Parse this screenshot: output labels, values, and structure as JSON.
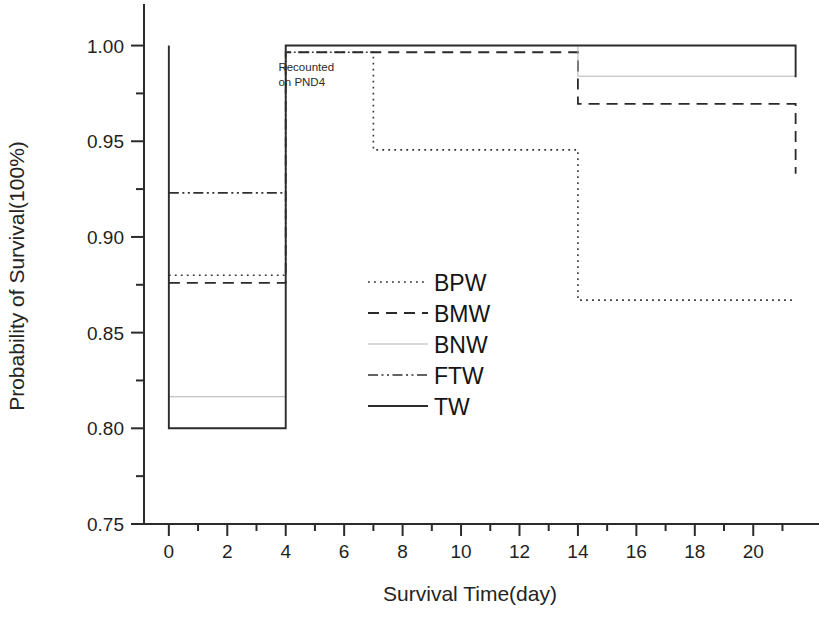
{
  "chart_data": {
    "type": "line",
    "title": "",
    "xlabel": "Survival Time(day)",
    "ylabel": "Probability of Survival(100%)",
    "xlim": [
      -0.85,
      21.6
    ],
    "ylim": [
      0.75,
      1.005
    ],
    "xticks": [
      0,
      2,
      4,
      6,
      8,
      10,
      12,
      14,
      16,
      18,
      20
    ],
    "xticklabels": [
      "0",
      "2",
      "4",
      "6",
      "8",
      "10",
      "12",
      "14",
      "16",
      "18",
      "20"
    ],
    "xminorticks": [
      1,
      3,
      5,
      7,
      9,
      11,
      13,
      15,
      17,
      19,
      21
    ],
    "yticks": [
      0.75,
      0.8,
      0.85,
      0.9,
      0.95,
      1.0
    ],
    "yticklabels": [
      "0.75",
      "0.80",
      "0.85",
      "0.90",
      "0.95",
      "1.00"
    ],
    "yminorticks": [
      0.775,
      0.825,
      0.875,
      0.925,
      0.975
    ],
    "grid": false,
    "legend_position": "center",
    "annotations": [
      {
        "name": "recounted-note",
        "line1": "Recounted",
        "line2": "on PND4",
        "x": 3.75,
        "y": 0.9865
      }
    ],
    "series": [
      {
        "name": "BPW",
        "style": "dotted",
        "color": "#333333",
        "width": 1.6,
        "steps": [
          {
            "x": 0,
            "y": 0.88
          },
          {
            "x": 4,
            "y": 0.88
          },
          {
            "x": 4,
            "y": 0.9965
          },
          {
            "x": 7,
            "y": 0.9965
          },
          {
            "x": 7,
            "y": 0.9455
          },
          {
            "x": 14,
            "y": 0.9455
          },
          {
            "x": 14,
            "y": 0.867
          },
          {
            "x": 21.45,
            "y": 0.867
          }
        ]
      },
      {
        "name": "BMW",
        "style": "dashed",
        "color": "#2a2a2a",
        "width": 1.8,
        "steps": [
          {
            "x": 0,
            "y": 0.876
          },
          {
            "x": 4,
            "y": 0.876
          },
          {
            "x": 4,
            "y": 0.9965
          },
          {
            "x": 14,
            "y": 0.9965
          },
          {
            "x": 14,
            "y": 0.9695
          },
          {
            "x": 21.45,
            "y": 0.9695
          },
          {
            "x": 21.45,
            "y": 0.933
          }
        ]
      },
      {
        "name": "BNW",
        "style": "thin-solid",
        "color": "#b4b4b4",
        "width": 1.0,
        "steps": [
          {
            "x": 0,
            "y": 0.8165
          },
          {
            "x": 4,
            "y": 0.8165
          },
          {
            "x": 4,
            "y": 1.0
          },
          {
            "x": 14,
            "y": 1.0
          },
          {
            "x": 14,
            "y": 0.984
          },
          {
            "x": 21.45,
            "y": 0.984
          }
        ]
      },
      {
        "name": "FTW",
        "style": "dash-dot-dot",
        "color": "#303030",
        "width": 1.7,
        "steps": [
          {
            "x": 0,
            "y": 0.923
          },
          {
            "x": 4,
            "y": 0.923
          }
        ]
      },
      {
        "name": "TW",
        "style": "solid",
        "color": "#2b2b2b",
        "width": 1.9,
        "steps": [
          {
            "x": 0,
            "y": 1.0
          },
          {
            "x": 0,
            "y": 0.8
          },
          {
            "x": 4,
            "y": 0.8
          },
          {
            "x": 4,
            "y": 1.0
          },
          {
            "x": 21.45,
            "y": 1.0
          },
          {
            "x": 21.45,
            "y": 0.9835
          }
        ]
      }
    ],
    "legend": [
      {
        "label": "BPW",
        "style": "dotted"
      },
      {
        "label": "BMW",
        "style": "dashed"
      },
      {
        "label": "BNW",
        "style": "thin-solid"
      },
      {
        "label": "FTW",
        "style": "dash-dot-dot"
      },
      {
        "label": "TW",
        "style": "solid"
      }
    ]
  }
}
